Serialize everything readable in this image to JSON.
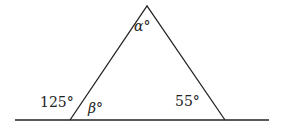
{
  "diagram": {
    "type": "geometry-triangle-angles",
    "stroke_color": "#222222",
    "background": "#ffffff",
    "baseline": {
      "x1": 15,
      "y1": 120,
      "x2": 269,
      "y2": 120
    },
    "vertices": {
      "apex": {
        "x": 147,
        "y": 6
      },
      "bottom_left": {
        "x": 70,
        "y": 120
      },
      "bottom_right": {
        "x": 225,
        "y": 120
      }
    },
    "labels": {
      "alpha": {
        "text": "α°",
        "x": 134,
        "y": 31
      },
      "beta": {
        "text": "β°",
        "x": 88,
        "y": 113
      },
      "exterior_left": {
        "text": "125°",
        "x": 40,
        "y": 107
      },
      "interior_right": {
        "text": "55°",
        "x": 175,
        "y": 106
      }
    }
  }
}
